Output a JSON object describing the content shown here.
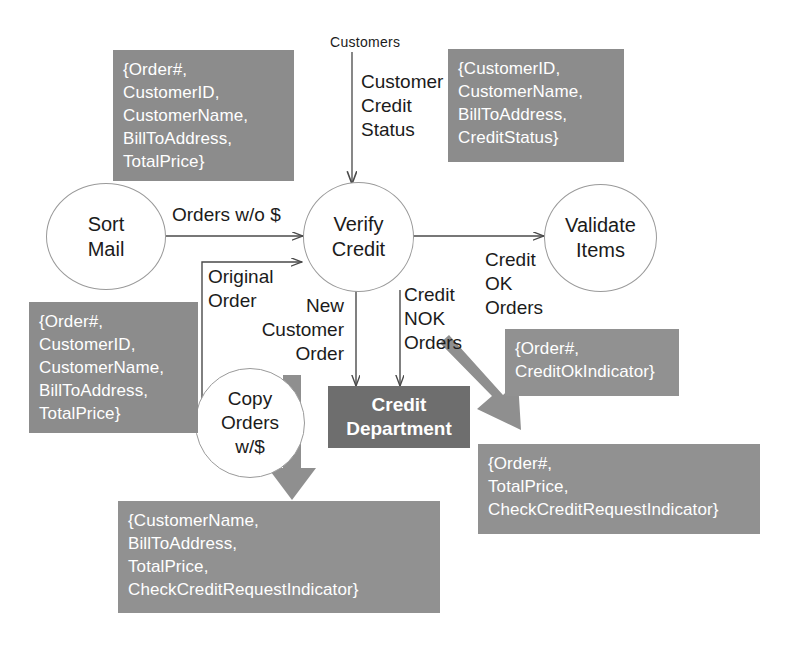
{
  "diagram": {
    "colors": {
      "data_box_fill": "#8c8c8c",
      "data_box_fill_light": "#919191",
      "process_box_fill": "#6e6e6e",
      "circle_stroke": "#9a9a9a",
      "text_dark": "#1b1b1b",
      "text_light": "#ffffff",
      "thin_arrow": "#4a4a4a",
      "thick_arrow": "#8f8f8f"
    },
    "external_entities": [
      {
        "id": "customers",
        "label": "Customers"
      }
    ],
    "processes": [
      {
        "id": "sort-mail",
        "label": "Sort\nMail"
      },
      {
        "id": "verify-credit",
        "label": "Verify\nCredit"
      },
      {
        "id": "validate-items",
        "label": "Validate\nItems"
      },
      {
        "id": "copy-orders",
        "label": "Copy\nOrders\nw/$"
      }
    ],
    "process_boxes": [
      {
        "id": "credit-department",
        "label": "Credit\nDepartment"
      }
    ],
    "flow_labels": [
      {
        "id": "orders-wo-dollar",
        "label": "Orders w/o $"
      },
      {
        "id": "customer-credit-status",
        "label": "Customer\nCredit\nStatus"
      },
      {
        "id": "original-order",
        "label": "Original\nOrder"
      },
      {
        "id": "new-customer-order",
        "label": "New\nCustomer\nOrder"
      },
      {
        "id": "credit-nok-orders",
        "label": "Credit\nNOK\nOrders"
      },
      {
        "id": "credit-ok-orders",
        "label": "Credit\nOK\nOrders"
      }
    ],
    "data_boxes": [
      {
        "id": "sort-mail-input-attrs",
        "label": "{Order#,\nCustomerID,\nCustomerName,\nBillToAddress,\nTotalPrice}"
      },
      {
        "id": "customer-credit-status-attrs",
        "label": "{CustomerID,\nCustomerName,\nBillToAddress,\nCreditStatus}"
      },
      {
        "id": "original-order-attrs",
        "label": "{Order#,\nCustomerID,\nCustomerName,\nBillToAddress,\nTotalPrice}"
      },
      {
        "id": "credit-ok-orders-attrs",
        "label": "{Order#,\nCreditOkIndicator}"
      },
      {
        "id": "credit-nok-orders-attrs",
        "label": "{Order#,\nTotalPrice,\nCheckCreditRequestIndicator}"
      },
      {
        "id": "new-customer-order-attrs",
        "label": "{CustomerName,\nBillToAddress,\nTotalPrice,\nCheckCreditRequestIndicator}"
      }
    ]
  }
}
